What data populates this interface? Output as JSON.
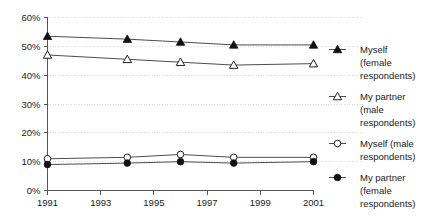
{
  "chart_data": {
    "type": "line",
    "title": "",
    "subtitle": "",
    "xlabel": "",
    "ylabel": "",
    "x": [
      1991,
      1994,
      1996,
      1998,
      2001
    ],
    "xlim": [
      1991,
      2001
    ],
    "ylim": [
      0,
      60
    ],
    "grid": true,
    "legend_position": "right",
    "x_tick_labels": [
      "1991",
      "1993",
      "1995",
      "1997",
      "1999",
      "2001"
    ],
    "x_tick_values": [
      1991,
      1993,
      1995,
      1997,
      1999,
      2001
    ],
    "y_tick_labels": [
      "0%",
      "10%",
      "20%",
      "30%",
      "40%",
      "50%",
      "60%"
    ],
    "y_tick_values": [
      0,
      10,
      20,
      30,
      40,
      50,
      60
    ],
    "series": [
      {
        "name": "Myself (female respondents)",
        "marker": "filled-triangle",
        "values": [
          53.5,
          52.5,
          51.5,
          50.5,
          50.5
        ]
      },
      {
        "name": "My partner (male respondents)",
        "marker": "open-triangle",
        "values": [
          47.0,
          45.5,
          44.5,
          43.5,
          44.0
        ]
      },
      {
        "name": "Myself (male respondents)",
        "marker": "open-circle",
        "values": [
          11.0,
          11.5,
          12.5,
          11.5,
          11.5
        ]
      },
      {
        "name": "My partner (female respondents)",
        "marker": "filled-circle",
        "values": [
          9.0,
          9.5,
          10.0,
          9.5,
          10.0
        ]
      }
    ]
  },
  "legend": {
    "items": [
      {
        "marker": "filled-triangle",
        "lines": [
          "Myself",
          "(female",
          "respondents)"
        ]
      },
      {
        "marker": "open-triangle",
        "lines": [
          "My partner",
          "(male",
          "respondents)"
        ]
      },
      {
        "marker": "open-circle",
        "lines": [
          "Myself (male",
          "respondents)"
        ]
      },
      {
        "marker": "filled-circle",
        "lines": [
          "My partner",
          "(female",
          "respondents)"
        ]
      }
    ]
  },
  "axis": {
    "y_labels": [
      "60%",
      "50%",
      "40%",
      "30%",
      "20%",
      "10%",
      "0%"
    ],
    "x_labels": [
      "1991",
      "1993",
      "1995",
      "1997",
      "1999",
      "2001"
    ]
  },
  "colors": {
    "line": "#4d4d4d",
    "grid": "#dcdcdc",
    "axis": "#555555",
    "marker_fill": "#111111",
    "marker_open": "#ffffff",
    "text": "#1a1a1a",
    "background": "#ffffff"
  }
}
